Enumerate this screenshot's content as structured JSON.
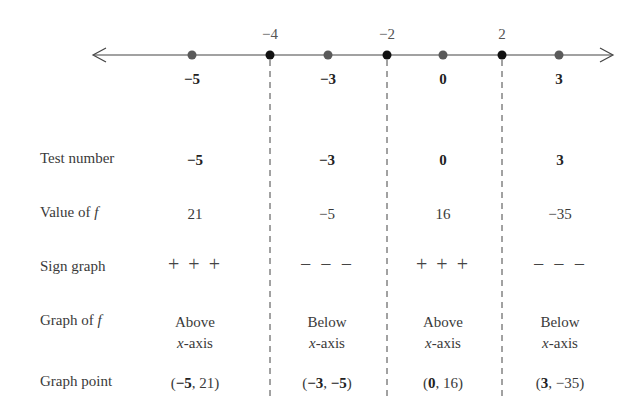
{
  "number_line": {
    "critical_points": [
      {
        "value": -4,
        "label": "−4"
      },
      {
        "value": -2,
        "label": "−2"
      },
      {
        "value": 2,
        "label": "2"
      }
    ],
    "test_points": [
      {
        "value": -5,
        "label": "−5"
      },
      {
        "value": -3,
        "label": "−3"
      },
      {
        "value": 0,
        "label": "0"
      },
      {
        "value": 3,
        "label": "3"
      }
    ],
    "colors": {
      "critical": "#111111",
      "test": "#5a5a5a",
      "line": "#444444"
    }
  },
  "rows": {
    "test_number": {
      "label": "Test number",
      "values": [
        "−5",
        "−3",
        "0",
        "3"
      ]
    },
    "value_of_f": {
      "label_prefix": "Value of ",
      "label_var": "f",
      "values": [
        "21",
        "−5",
        "16",
        "−35"
      ]
    },
    "sign_graph": {
      "label": "Sign graph",
      "values": [
        "+++",
        "−−−",
        "+++",
        "−−−"
      ]
    },
    "graph_of_f": {
      "label_prefix": "Graph of ",
      "label_var": "f",
      "values": [
        {
          "position": "Above",
          "axis_var": "x",
          "axis_suffix": "-axis"
        },
        {
          "position": "Below",
          "axis_var": "x",
          "axis_suffix": "-axis"
        },
        {
          "position": "Above",
          "axis_var": "x",
          "axis_suffix": "-axis"
        },
        {
          "position": "Below",
          "axis_var": "x",
          "axis_suffix": "-axis"
        }
      ]
    },
    "graph_point": {
      "label": "Graph point",
      "values": [
        {
          "x": "−5",
          "y": "21"
        },
        {
          "x": "−3",
          "y": "−5"
        },
        {
          "x": "0",
          "y": "16"
        },
        {
          "x": "3",
          "y": "−35"
        }
      ]
    }
  }
}
